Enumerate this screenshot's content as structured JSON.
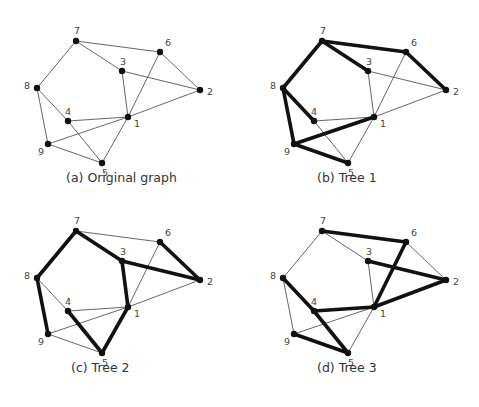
{
  "nodes": {
    "1": {
      "x": 128,
      "y": 117,
      "lx": 6,
      "ly": 10
    },
    "2": {
      "x": 200,
      "y": 90,
      "lx": 7,
      "ly": 5
    },
    "3": {
      "x": 122,
      "y": 71,
      "lx": -2,
      "ly": -6
    },
    "4": {
      "x": 68,
      "y": 121,
      "lx": -3,
      "ly": -6
    },
    "5": {
      "x": 102,
      "y": 163,
      "lx": 0,
      "ly": 13
    },
    "6": {
      "x": 160,
      "y": 52,
      "lx": 5,
      "ly": -6
    },
    "7": {
      "x": 76,
      "y": 41,
      "lx": -2,
      "ly": -7
    },
    "8": {
      "x": 37,
      "y": 88,
      "lx": -13,
      "ly": 1
    },
    "9": {
      "x": 48,
      "y": 144,
      "lx": -10,
      "ly": 11
    }
  },
  "edges": [
    [
      "7",
      "6"
    ],
    [
      "7",
      "3"
    ],
    [
      "7",
      "8"
    ],
    [
      "6",
      "2"
    ],
    [
      "6",
      "1"
    ],
    [
      "3",
      "2"
    ],
    [
      "3",
      "1"
    ],
    [
      "1",
      "2"
    ],
    [
      "8",
      "4"
    ],
    [
      "8",
      "9"
    ],
    [
      "4",
      "1"
    ],
    [
      "4",
      "5"
    ],
    [
      "9",
      "1"
    ],
    [
      "9",
      "5"
    ],
    [
      "1",
      "5"
    ]
  ],
  "panels": [
    {
      "id": "a",
      "caption": "(a) Original graph",
      "offset": [
        0,
        0
      ],
      "caption_pos": [
        66,
        178
      ],
      "tree_edges": []
    },
    {
      "id": "b",
      "caption": "(b) Tree 1",
      "offset": [
        246,
        0
      ],
      "caption_pos": [
        317,
        178
      ],
      "tree_edges": [
        [
          "7",
          "6"
        ],
        [
          "7",
          "3"
        ],
        [
          "7",
          "8"
        ],
        [
          "6",
          "2"
        ],
        [
          "8",
          "4"
        ],
        [
          "8",
          "9"
        ],
        [
          "9",
          "1"
        ],
        [
          "9",
          "5"
        ]
      ]
    },
    {
      "id": "c",
      "caption": "(c) Tree 2",
      "offset": [
        0,
        190
      ],
      "caption_pos": [
        70,
        368
      ],
      "tree_edges": [
        [
          "7",
          "8"
        ],
        [
          "7",
          "3"
        ],
        [
          "3",
          "2"
        ],
        [
          "6",
          "2"
        ],
        [
          "3",
          "1"
        ],
        [
          "1",
          "5"
        ],
        [
          "4",
          "5"
        ],
        [
          "8",
          "9"
        ]
      ]
    },
    {
      "id": "d",
      "caption": "(d) Tree 3",
      "offset": [
        246,
        190
      ],
      "caption_pos": [
        317,
        368
      ],
      "tree_edges": [
        [
          "7",
          "6"
        ],
        [
          "6",
          "1"
        ],
        [
          "3",
          "2"
        ],
        [
          "1",
          "2"
        ],
        [
          "4",
          "1"
        ],
        [
          "8",
          "4"
        ],
        [
          "4",
          "5"
        ],
        [
          "9",
          "5"
        ]
      ]
    }
  ],
  "captions": {
    "a": "(a) Original graph",
    "b": "(b) Tree 1",
    "c": "(c) Tree 2",
    "d": "(d) Tree 3"
  }
}
